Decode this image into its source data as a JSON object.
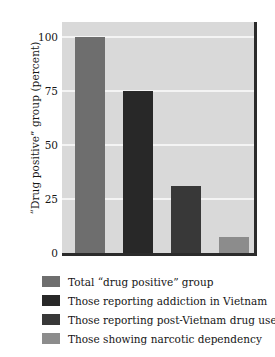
{
  "chart_data": {
    "type": "bar",
    "title": "",
    "xlabel": "",
    "ylabel": "“Drug positive” group (percent)",
    "ylim": [
      0,
      107
    ],
    "grid": true,
    "legend_position": "below",
    "yticks": [
      0,
      25,
      50,
      75,
      100
    ],
    "ytick_labels": [
      "0",
      "25",
      "50",
      "75",
      "100"
    ],
    "categories": [
      "Total “drug positive” group",
      "Those reporting addiction in Vietnam",
      "Those reporting post-Vietnam drug use",
      "Those showing narcotic dependency"
    ],
    "values": [
      100,
      75,
      31,
      7.5
    ],
    "colors": [
      "#6e6e6e",
      "#282828",
      "#383838",
      "#8c8c8c"
    ],
    "plot_background": "#d9d9d9",
    "gridline_color": "#f4f4f4",
    "axis_color": "#2b2b2b"
  },
  "legend": {
    "items": [
      {
        "label": "Total “drug positive” group",
        "color": "#6e6e6e"
      },
      {
        "label": "Those reporting addiction in Vietnam",
        "color": "#282828"
      },
      {
        "label": "Those reporting post-Vietnam drug use",
        "color": "#383838"
      },
      {
        "label": "Those showing narcotic dependency",
        "color": "#8c8c8c"
      }
    ]
  }
}
